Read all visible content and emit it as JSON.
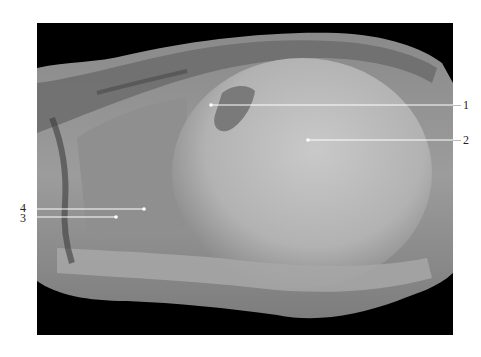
{
  "figure": {
    "type": "anatomical-dissection-photograph",
    "color_mode": "grayscale",
    "background": "#000000",
    "labels": [
      {
        "id": "1",
        "text": "1",
        "side": "right",
        "line_y": 105,
        "line_x_start": 211,
        "line_x_end": 453
      },
      {
        "id": "2",
        "text": "2",
        "side": "right",
        "line_y": 140,
        "line_x_start": 308,
        "line_x_end": 453
      },
      {
        "id": "4",
        "text": "4",
        "side": "left",
        "line_y": 209,
        "line_x_start": 37,
        "line_x_end": 144
      },
      {
        "id": "3",
        "text": "3",
        "side": "left",
        "line_y": 217,
        "line_x_start": 37,
        "line_x_end": 116
      }
    ],
    "leader_line_color": "#ffffff"
  }
}
